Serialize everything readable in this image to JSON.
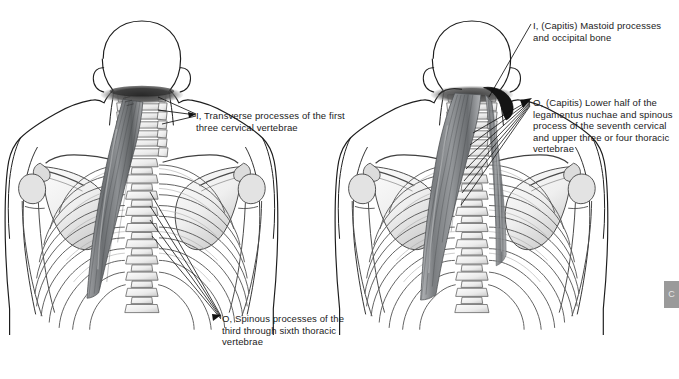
{
  "page": {
    "kind": "anatomy-illustration",
    "background_color": "#ffffff",
    "ink_color": "#1b1b1b",
    "width": 679,
    "height": 379
  },
  "figures": [
    {
      "id": "left-figure",
      "muscle": "splenius cervicis",
      "view": "posterior",
      "shaded_muscle_side": "left side of neck"
    },
    {
      "id": "right-figure",
      "muscle": "splenius capitis",
      "view": "posterior",
      "shaded_muscle_side": "left side of neck"
    }
  ],
  "callouts": {
    "left_insertion": {
      "text": "I, Transverse processes of the first three cervical vertebrae",
      "marker": "I",
      "leader_count": 3
    },
    "left_origin": {
      "text": "O, Spinous processes of the third through sixth thoracic vertebrae",
      "marker": "O",
      "leader_count": 4
    },
    "right_insertion": {
      "text": "I, (Capitis) Mastoid processes and occipital bone",
      "marker": "I",
      "leader_count": 1
    },
    "right_origin": {
      "text": "O, (Capitis) Lower half of the legamentus nuchae and spinous process of the seventh cervical and upper three or four thoracic vertebrae",
      "marker": "O",
      "leader_count": 7
    }
  },
  "edge_tab": {
    "label": "C",
    "color": "#9a9a9a"
  }
}
